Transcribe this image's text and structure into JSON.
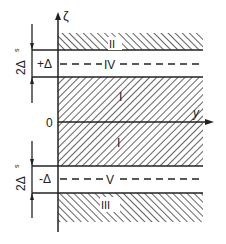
{
  "diagram": {
    "axes": {
      "vertical_label": "ζ",
      "horizontal_label": "y",
      "origin_label": "0"
    },
    "regions": [
      {
        "id": "II",
        "label": "II",
        "hatch": "backslash"
      },
      {
        "id": "IV",
        "label": "IV",
        "style": "dashed-line"
      },
      {
        "id": "I_upper",
        "label": "I",
        "hatch": "slash"
      },
      {
        "id": "I_lower",
        "label": "I",
        "hatch": "slash"
      },
      {
        "id": "V",
        "label": "V",
        "style": "dashed-line"
      },
      {
        "id": "III",
        "label": "III",
        "hatch": "backslash"
      }
    ],
    "levels": {
      "upper": "+Δ",
      "lower": "-Δ"
    },
    "dimensions": {
      "upper_width": "2Δ",
      "upper_width_sub": "s",
      "lower_width": "2Δ",
      "lower_width_sub": "s"
    },
    "colors": {
      "ink": "#222222",
      "background": "#ffffff"
    }
  }
}
